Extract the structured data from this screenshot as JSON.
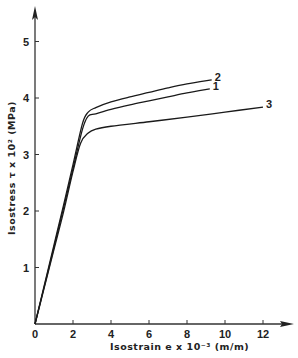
{
  "chart_data": {
    "type": "line",
    "title": "",
    "xlabel": "Isostrain  e x 10⁻³ (m/m)",
    "ylabel": "Isostress  τ x 10² (MPa)",
    "xlim": [
      0,
      13
    ],
    "ylim": [
      0,
      5.5
    ],
    "x_ticks": [
      0,
      2,
      4,
      6,
      8,
      10,
      12
    ],
    "x_tick_labels": [
      "0",
      "2",
      "4",
      "6",
      "8",
      "10",
      "12"
    ],
    "y_ticks": [
      1,
      2,
      3,
      4,
      5
    ],
    "y_tick_labels": [
      "1",
      "2",
      "3",
      "4",
      "5"
    ],
    "grid": false,
    "legend": "inline labels at line ends",
    "series": [
      {
        "name": "1",
        "x": [
          0,
          0.5,
          1.0,
          1.5,
          2.0,
          2.5,
          2.8,
          3.2,
          4,
          5,
          6,
          7,
          8,
          9.2
        ],
        "y": [
          0,
          0.68,
          1.36,
          2.05,
          2.75,
          3.45,
          3.68,
          3.72,
          3.8,
          3.88,
          3.95,
          4.02,
          4.09,
          4.16
        ]
      },
      {
        "name": "2",
        "x": [
          0,
          0.5,
          1.0,
          1.5,
          2.0,
          2.5,
          2.8,
          3.2,
          4,
          5,
          6,
          7,
          8,
          9.3
        ],
        "y": [
          0,
          0.7,
          1.4,
          2.1,
          2.82,
          3.55,
          3.75,
          3.83,
          3.93,
          4.02,
          4.1,
          4.18,
          4.25,
          4.32
        ]
      },
      {
        "name": "3",
        "x": [
          0,
          0.5,
          1.0,
          1.5,
          2.0,
          2.4,
          2.8,
          3.2,
          4,
          6,
          8,
          10,
          12
        ],
        "y": [
          0,
          0.66,
          1.32,
          1.98,
          2.7,
          3.2,
          3.38,
          3.45,
          3.5,
          3.58,
          3.66,
          3.75,
          3.84
        ]
      }
    ]
  }
}
